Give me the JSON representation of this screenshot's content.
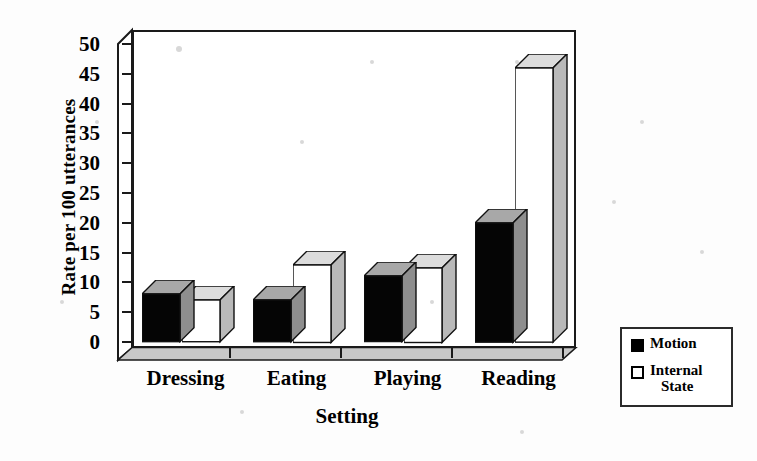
{
  "chart_data": {
    "type": "bar",
    "title": "",
    "xlabel": "Setting",
    "ylabel": "Rate per 100 utterances",
    "categories": [
      "Dressing",
      "Eating",
      "Playing",
      "Reading"
    ],
    "series": [
      {
        "name": "Motion",
        "values": [
          8,
          7,
          11,
          20
        ],
        "color": "#000000"
      },
      {
        "name": "Internal State",
        "values": [
          7,
          13,
          12.5,
          46
        ],
        "color": "#ffffff"
      }
    ],
    "ylim": [
      0,
      50
    ],
    "yticks": [
      0,
      5,
      10,
      15,
      20,
      25,
      30,
      35,
      40,
      45,
      50
    ],
    "ytick_labels": [
      "0",
      "5",
      "10",
      "15",
      "20",
      "25",
      "30",
      "35",
      "40",
      "45",
      "50"
    ],
    "grid": false,
    "legend_position": "right-bottom",
    "style": "3d-bar-black-and-white"
  },
  "axes": {
    "y_title": "Rate per 100 utterances",
    "x_title": "Setting"
  },
  "legend": {
    "entries": [
      {
        "label": "Motion",
        "swatch": "filled-square",
        "line1": "Motion",
        "line2": ""
      },
      {
        "label": "Internal State",
        "swatch": "hollow-square",
        "line1": "Internal",
        "line2": "State"
      }
    ]
  }
}
